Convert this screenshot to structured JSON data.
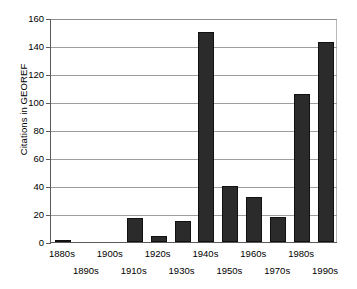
{
  "chart_data": {
    "type": "bar",
    "title": "",
    "xlabel": "",
    "ylabel": "Citations in GEOREF",
    "categories": [
      "1880s",
      "1890s",
      "1900s",
      "1910s",
      "1920s",
      "1930s",
      "1940s",
      "1950s",
      "1960s",
      "1970s",
      "1980s",
      "1990s"
    ],
    "values": [
      1,
      0,
      0,
      17,
      4,
      15,
      150,
      40,
      32,
      18,
      106,
      143
    ],
    "ylim": [
      0,
      160
    ],
    "yticks": [
      0,
      20,
      40,
      60,
      80,
      100,
      120,
      140,
      160
    ],
    "grid": true,
    "legend": "none",
    "bar_color": "#2b2b2b"
  }
}
